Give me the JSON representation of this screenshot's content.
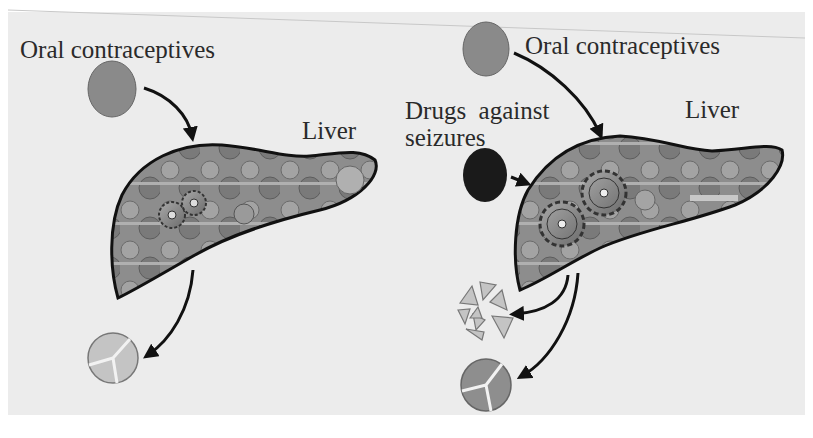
{
  "diagram": {
    "colors": {
      "background": "#ececec",
      "contraceptive_pill": "#8a8a8a",
      "seizure_drug": "#1a1a1a",
      "metabolite_light": "#c4c4c4",
      "metabolite_dark": "#8e8e8e",
      "liver_outline": "#111111"
    },
    "left_panel": {
      "drug_label": "Oral contraceptives",
      "organ_label": "Liver",
      "gears_count": 2,
      "output": "intact drug (partially metabolized)"
    },
    "right_panel": {
      "drug_label": "Oral contraceptives",
      "second_drug_label_line1": "Drugs  against",
      "second_drug_label_line2": "seizures",
      "organ_label": "Liver",
      "gears_count": 2,
      "outputs": [
        "broken-down drug fragments",
        "metabolized drug"
      ]
    }
  }
}
